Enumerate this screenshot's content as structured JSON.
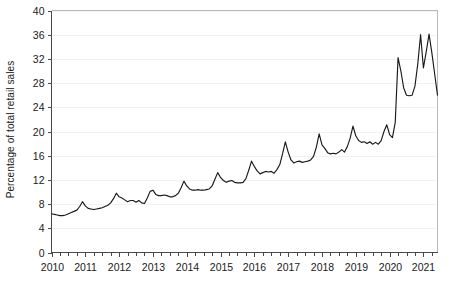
{
  "chart_data": {
    "type": "line",
    "title": "",
    "subtitle": "",
    "xlabel": "",
    "ylabel": "Percentage of total retail sales",
    "ylim": [
      0,
      40
    ],
    "ytick_values": [
      0,
      4,
      8,
      12,
      16,
      20,
      24,
      28,
      32,
      36,
      40
    ],
    "ytick_labels": [
      "0",
      "4",
      "8",
      "12",
      "16",
      "20",
      "24",
      "28",
      "32",
      "36",
      "40"
    ],
    "xlim": [
      "2010-01",
      "2021-06"
    ],
    "xtick_labels": [
      "2010",
      "2011",
      "2012",
      "2013",
      "2014",
      "2015",
      "2016",
      "2017",
      "2018",
      "2019",
      "2020",
      "2021"
    ],
    "xtick_years": [
      2010,
      2011,
      2012,
      2013,
      2014,
      2015,
      2016,
      2017,
      2018,
      2019,
      2020,
      2021
    ],
    "x_minor_ticks_per_year": 4,
    "grid": "horizontal",
    "legend": "none",
    "line_color": "#1a1a1a",
    "series": [
      {
        "name": "Percentage of total retail sales",
        "x_start": "2010-01",
        "frequency": "monthly",
        "values": [
          6.4,
          6.3,
          6.2,
          6.1,
          6.1,
          6.2,
          6.4,
          6.6,
          6.8,
          7.0,
          7.6,
          8.4,
          7.7,
          7.3,
          7.2,
          7.1,
          7.2,
          7.3,
          7.4,
          7.6,
          7.8,
          8.2,
          8.9,
          9.8,
          9.2,
          9.0,
          8.7,
          8.4,
          8.6,
          8.6,
          8.3,
          8.6,
          8.2,
          8.1,
          9.0,
          10.1,
          10.3,
          9.6,
          9.4,
          9.4,
          9.5,
          9.4,
          9.2,
          9.2,
          9.4,
          9.8,
          10.7,
          11.8,
          11.0,
          10.5,
          10.3,
          10.3,
          10.4,
          10.3,
          10.3,
          10.4,
          10.5,
          11.0,
          12.1,
          13.2,
          12.4,
          11.9,
          11.6,
          11.8,
          11.9,
          11.6,
          11.5,
          11.5,
          11.6,
          12.2,
          13.6,
          15.1,
          14.2,
          13.5,
          13.0,
          13.2,
          13.4,
          13.3,
          13.4,
          13.1,
          13.7,
          14.5,
          16.3,
          18.3,
          16.6,
          15.3,
          14.8,
          15.0,
          15.1,
          14.9,
          15.0,
          15.1,
          15.3,
          15.9,
          17.4,
          19.6,
          17.8,
          17.2,
          16.5,
          16.3,
          16.4,
          16.3,
          16.6,
          17.0,
          16.6,
          17.5,
          18.9,
          20.9,
          19.3,
          18.5,
          18.2,
          18.3,
          18.0,
          18.3,
          17.9,
          18.2,
          17.9,
          18.5,
          20.0,
          21.1,
          19.5,
          19.0,
          21.5,
          32.2,
          30.0,
          27.2,
          26.0,
          25.9,
          26.0,
          27.5,
          31.2,
          36.0,
          30.5,
          33.2,
          36.1,
          33.0,
          29.5,
          26.0
        ]
      }
    ]
  },
  "axis": {
    "ylabel": "Percentage of total retail sales"
  }
}
